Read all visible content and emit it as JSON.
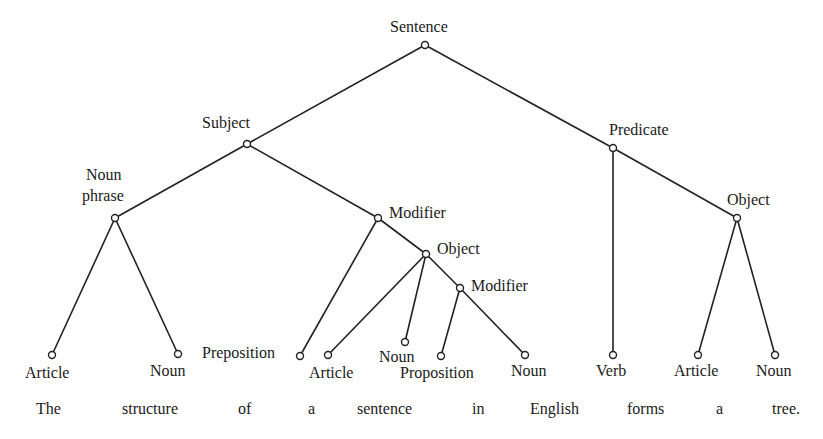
{
  "diagram": {
    "type": "tree",
    "nodes": [
      {
        "id": "sentence",
        "label": "Sentence"
      },
      {
        "id": "subject",
        "label": "Subject"
      },
      {
        "id": "predicate",
        "label": "Predicate"
      },
      {
        "id": "noun_phrase",
        "label": "Noun phrase",
        "label_line1": "Noun",
        "label_line2": "phrase"
      },
      {
        "id": "modifier1",
        "label": "Modifier"
      },
      {
        "id": "object_pred",
        "label": "Object"
      },
      {
        "id": "object_mod",
        "label": "Object"
      },
      {
        "id": "modifier2",
        "label": "Modifier"
      },
      {
        "id": "article1",
        "label": "Article"
      },
      {
        "id": "noun1",
        "label": "Noun"
      },
      {
        "id": "preposition",
        "label": "Preposition"
      },
      {
        "id": "article2",
        "label": "Article"
      },
      {
        "id": "noun2",
        "label": "Noun"
      },
      {
        "id": "proposition",
        "label": "Proposition"
      },
      {
        "id": "noun3",
        "label": "Noun"
      },
      {
        "id": "verb",
        "label": "Verb"
      },
      {
        "id": "article3",
        "label": "Article"
      },
      {
        "id": "noun4",
        "label": "Noun"
      }
    ],
    "edges": [
      [
        "sentence",
        "subject"
      ],
      [
        "sentence",
        "predicate"
      ],
      [
        "subject",
        "noun_phrase"
      ],
      [
        "subject",
        "modifier1"
      ],
      [
        "noun_phrase",
        "article1"
      ],
      [
        "noun_phrase",
        "noun1"
      ],
      [
        "modifier1",
        "preposition"
      ],
      [
        "modifier1",
        "object_mod"
      ],
      [
        "object_mod",
        "article2"
      ],
      [
        "object_mod",
        "noun2"
      ],
      [
        "object_mod",
        "modifier2"
      ],
      [
        "modifier2",
        "proposition"
      ],
      [
        "modifier2",
        "noun3"
      ],
      [
        "predicate",
        "verb"
      ],
      [
        "predicate",
        "object_pred"
      ],
      [
        "object_pred",
        "article3"
      ],
      [
        "object_pred",
        "noun4"
      ]
    ]
  },
  "caption": {
    "words": [
      "The",
      "structure",
      "of",
      "a",
      "sentence",
      "in",
      "English",
      "forms",
      "a",
      "tree."
    ]
  }
}
